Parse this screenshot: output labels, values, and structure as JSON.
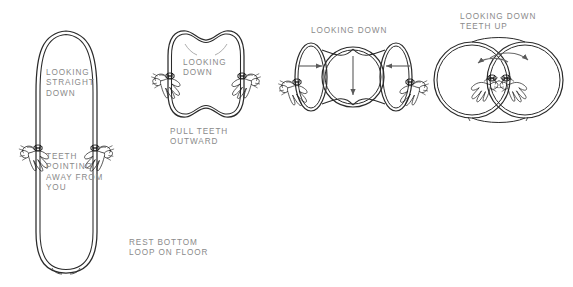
{
  "figure": {
    "title_cut_off": "",
    "background_color": "#ffffff",
    "line_color": "#1a1a1a",
    "text_color": "#8a8a8a",
    "panels": [
      {
        "id": "panel-1-hanging-loop",
        "shape": "stadium-oval",
        "labels": [
          {
            "id": "looking-straight-down",
            "text": "LOOKING\nSTRAIGHT\nDOWN",
            "x": 46,
            "y": 68
          },
          {
            "id": "teeth-pointing-away-from-you",
            "text": "TEETH\nPOINTING\nAWAY FROM\nYOU",
            "x": 46,
            "y": 152
          },
          {
            "id": "rest-bottom-loop-on-floor",
            "text": "REST BOTTOM\nLOOP ON FLOOR",
            "x": 129,
            "y": 238
          }
        ],
        "hands": 2
      },
      {
        "id": "panel-2-tooth-shape",
        "shape": "tooth",
        "labels": [
          {
            "id": "looking-down-2",
            "text": "LOOKING\nDOWN",
            "x": 183,
            "y": 58
          },
          {
            "id": "pull-teeth-outward",
            "text": "PULL TEETH\nOUTWARD",
            "x": 170,
            "y": 127
          }
        ],
        "hands": 2,
        "action": "pull outward"
      },
      {
        "id": "panel-3-figure-eight-coil",
        "shape": "triple-lobe-twist",
        "labels": [
          {
            "id": "looking-down-3",
            "text": "LOOKING DOWN",
            "x": 311,
            "y": 26
          }
        ],
        "hands": 2,
        "arrows": [
          "left-inward",
          "right-inward",
          "center-down"
        ]
      },
      {
        "id": "panel-4-stacked-circles",
        "shape": "two-overlapping-circles",
        "labels": [
          {
            "id": "looking-down-teeth-up",
            "text": "LOOKING DOWN\nTEETH UP",
            "x": 460,
            "y": 12
          }
        ],
        "hands": 2,
        "arrows": [
          "curve-left",
          "curve-right"
        ]
      }
    ]
  }
}
